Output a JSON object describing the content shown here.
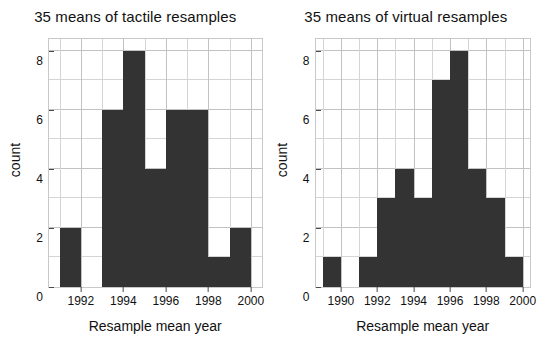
{
  "chart_data": [
    {
      "type": "bar",
      "title": "35 means of tactile resamples",
      "xlabel": "Resample mean year",
      "ylabel": "count",
      "categories": [
        1991,
        1992,
        1993,
        1994,
        1995,
        1996,
        1997,
        1998,
        1999
      ],
      "values": [
        2,
        0,
        6,
        8,
        4,
        6,
        6,
        1,
        2
      ],
      "bin_width": 1,
      "xlim": [
        1990.5,
        2000.5
      ],
      "ylim": [
        0,
        8.4
      ],
      "xticks": [
        1992,
        1994,
        1996,
        1998,
        2000
      ],
      "xtick_labels": [
        "1992",
        "1994",
        "1996",
        "1998",
        "2000"
      ],
      "yticks": [
        0,
        2,
        4,
        6,
        8
      ],
      "ytick_labels": [
        "0",
        "2",
        "4",
        "6",
        "8"
      ],
      "y_minor_gridlines": [
        1,
        3,
        5,
        7
      ],
      "grid": true,
      "legend": null,
      "bar_color": "#333333",
      "grid_color": "#d5d5d5",
      "total_count": 35
    },
    {
      "type": "bar",
      "title": "35 means of virtual resamples",
      "xlabel": "Resample mean year",
      "ylabel": "count",
      "categories": [
        1989,
        1990,
        1991,
        1992,
        1993,
        1994,
        1995,
        1996,
        1997,
        1998,
        1999
      ],
      "values": [
        1,
        0,
        1,
        3,
        4,
        3,
        7,
        8,
        4,
        3,
        1
      ],
      "bin_width": 1,
      "xlim": [
        1988.6,
        2000.4
      ],
      "ylim": [
        0,
        8.4
      ],
      "xticks": [
        1990,
        1992,
        1994,
        1996,
        1998,
        2000
      ],
      "xtick_labels": [
        "1990",
        "1992",
        "1994",
        "1996",
        "1998",
        "2000"
      ],
      "yticks": [
        0,
        2,
        4,
        6,
        8
      ],
      "ytick_labels": [
        "0",
        "2",
        "4",
        "6",
        "8"
      ],
      "y_minor_gridlines": [
        1,
        3,
        5,
        7
      ],
      "grid": true,
      "legend": null,
      "bar_color": "#333333",
      "grid_color": "#d5d5d5",
      "total_count": 35
    }
  ],
  "panels": [
    {
      "title": "35 means of tactile resamples",
      "xlabel": "Resample mean year",
      "ylabel": "count"
    },
    {
      "title": "35 means of virtual resamples",
      "xlabel": "Resample mean year",
      "ylabel": "count"
    }
  ]
}
